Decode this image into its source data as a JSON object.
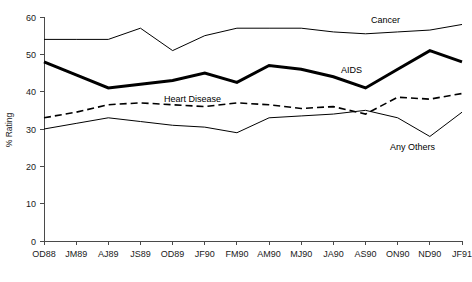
{
  "chart_data": {
    "type": "line",
    "title": "",
    "xlabel": "",
    "ylabel": "% Rating",
    "ylim": [
      0,
      60
    ],
    "yticks": [
      0,
      10,
      20,
      30,
      40,
      50,
      60
    ],
    "grid": false,
    "legend_position": "inline-annotations",
    "categories": [
      "OD88",
      "JM89",
      "AJ89",
      "JS89",
      "OD89",
      "JF90",
      "FM90",
      "AM90",
      "MJ90",
      "JA90",
      "AS90",
      "ON90",
      "ND90",
      "JF91"
    ],
    "series": [
      {
        "name": "Cancer",
        "style": "thin-solid",
        "color": "#000000",
        "values": [
          54,
          54,
          54,
          57,
          51,
          55,
          57,
          57,
          57,
          56,
          55.5,
          56,
          56.5,
          58
        ]
      },
      {
        "name": "AIDS",
        "style": "thick-solid",
        "color": "#000000",
        "values": [
          48,
          44.5,
          41,
          42,
          43,
          45,
          42.5,
          47,
          46,
          44,
          41,
          46,
          51,
          48
        ]
      },
      {
        "name": "Heart Disease",
        "style": "dashed",
        "color": "#000000",
        "values": [
          33,
          34.5,
          36.5,
          37,
          36.5,
          36,
          37,
          36.5,
          35.5,
          36,
          34,
          38.5,
          38,
          39.5
        ]
      },
      {
        "name": "Any Others",
        "style": "thin-solid",
        "color": "#000000",
        "values": [
          30,
          31.5,
          33,
          32,
          31,
          30.5,
          29,
          33,
          33.5,
          34,
          35,
          33,
          28,
          34.5
        ]
      }
    ],
    "annotations": [
      {
        "text": "Cancer",
        "x_px": 371,
        "y_px": 23
      },
      {
        "text": "AIDS",
        "x_px": 341,
        "y_px": 73
      },
      {
        "text": "Heart Disease",
        "x_px": 164,
        "y_px": 102
      },
      {
        "text": "Any Others",
        "x_px": 390,
        "y_px": 150
      }
    ]
  }
}
